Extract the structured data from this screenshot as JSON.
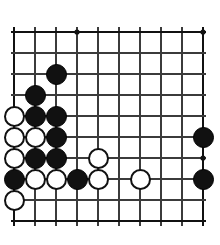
{
  "diagram": {
    "kind": "go-board-diagram",
    "board": {
      "columns": 10,
      "rows": 10,
      "origin_x": 14,
      "origin_y": 32,
      "spacing": 21,
      "line_color": "#3b3b3b",
      "edge_color": "#111111",
      "line_width": 1.4,
      "edge_width": 2.6,
      "background": "#ffffff",
      "star_point_radius": 2.6
    },
    "star_points": [
      {
        "col": 4,
        "row": 1
      },
      {
        "col": 10,
        "row": 1
      },
      {
        "col": 10,
        "row": 7
      }
    ],
    "stone_radius": 10.5,
    "colors": {
      "black": "#111111",
      "white": "#ffffff",
      "white_border": "#111111"
    },
    "stones": [
      {
        "col": 3,
        "row": 3,
        "color": "black"
      },
      {
        "col": 2,
        "row": 4,
        "color": "black"
      },
      {
        "col": 1,
        "row": 5,
        "color": "white"
      },
      {
        "col": 2,
        "row": 5,
        "color": "black"
      },
      {
        "col": 3,
        "row": 5,
        "color": "black"
      },
      {
        "col": 1,
        "row": 6,
        "color": "white"
      },
      {
        "col": 2,
        "row": 6,
        "color": "white"
      },
      {
        "col": 3,
        "row": 6,
        "color": "black"
      },
      {
        "col": 1,
        "row": 7,
        "color": "white"
      },
      {
        "col": 2,
        "row": 7,
        "color": "black"
      },
      {
        "col": 3,
        "row": 7,
        "color": "black"
      },
      {
        "col": 5,
        "row": 7,
        "color": "white"
      },
      {
        "col": 1,
        "row": 8,
        "color": "black"
      },
      {
        "col": 2,
        "row": 8,
        "color": "white"
      },
      {
        "col": 3,
        "row": 8,
        "color": "white"
      },
      {
        "col": 4,
        "row": 8,
        "color": "black"
      },
      {
        "col": 5,
        "row": 8,
        "color": "white"
      },
      {
        "col": 7,
        "row": 8,
        "color": "white"
      },
      {
        "col": 1,
        "row": 9,
        "color": "white"
      },
      {
        "col": 10,
        "row": 6,
        "color": "black"
      },
      {
        "col": 10,
        "row": 8,
        "color": "black"
      }
    ]
  }
}
